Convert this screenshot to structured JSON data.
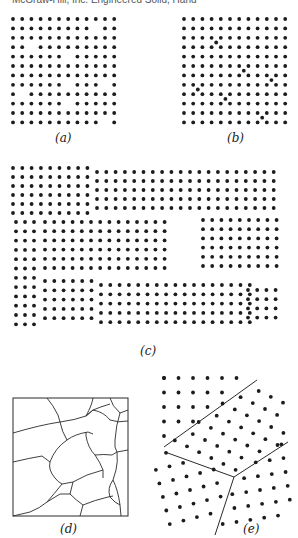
{
  "header": {
    "text": "McGraw-Hill, Inc. Engineered Solid, Hand"
  },
  "panels": {
    "a": {
      "label": "(a)",
      "description": "Square lattice with vacancies",
      "grid": {
        "x0": 13,
        "y0": 19,
        "dx": 9.2,
        "dy": 9.4,
        "cols": 12,
        "rows": 12
      },
      "vacancies": [
        [
          1,
          9
        ],
        [
          3,
          2
        ],
        [
          4,
          6
        ],
        [
          7,
          6
        ],
        [
          7,
          10
        ],
        [
          8,
          1
        ],
        [
          9,
          6
        ],
        [
          11,
          10
        ]
      ]
    },
    "b": {
      "label": "(b)",
      "description": "Square lattice with interstitials",
      "grid": {
        "x0": 184,
        "y0": 19,
        "dx": 9.2,
        "dy": 9.4,
        "cols": 12,
        "rows": 12
      },
      "interstitials": [
        [
          2.5,
          3.5
        ],
        [
          5.5,
          6.5
        ],
        [
          6.5,
          9.5
        ],
        [
          7.5,
          1.5
        ],
        [
          8.5,
          4.5
        ],
        [
          10.5,
          8.5
        ]
      ]
    },
    "c": {
      "label": "(c)",
      "description": "Polycrystalline lattice with grain boundaries",
      "grains": [
        {
          "x0": 13,
          "y0": 168,
          "dx": 9.3,
          "dy": 9.0,
          "cols": 9,
          "rows": 6
        },
        {
          "x0": 97,
          "y0": 172,
          "dx": 9.3,
          "dy": 9.0,
          "cols": 20,
          "rows": 5
        },
        {
          "x0": 16,
          "y0": 222,
          "dx": 9.0,
          "dy": 9.3,
          "cols": 3,
          "rows": 12
        },
        {
          "x0": 45,
          "y0": 222,
          "dx": 9.2,
          "dy": 9.2,
          "cols": 14,
          "rows": 6
        },
        {
          "x0": 203,
          "y0": 220,
          "dx": 9.2,
          "dy": 9.2,
          "cols": 9,
          "rows": 6
        },
        {
          "x0": 45,
          "y0": 281,
          "dx": 9.3,
          "dy": 9.3,
          "cols": 6,
          "rows": 5
        },
        {
          "x0": 101,
          "y0": 285,
          "dx": 9.3,
          "dy": 9.3,
          "cols": 17,
          "rows": 5
        },
        {
          "x0": 248,
          "y0": 290,
          "dx": 9.2,
          "dy": 9.2,
          "cols": 4,
          "rows": 4
        }
      ]
    },
    "d": {
      "label": "(d)",
      "description": "Grain structure (microstructure schematic)",
      "box": {
        "x": 13,
        "y": 398,
        "w": 115,
        "h": 118
      }
    },
    "e": {
      "label": "(e)",
      "description": "Three grains with differing lattice orientations meeting at a triple junction",
      "junction": {
        "x": 234,
        "y": 477
      }
    }
  },
  "colors": {
    "dot": "#1c1c1c",
    "line": "#2a2a2a",
    "background": "#ffffff"
  }
}
